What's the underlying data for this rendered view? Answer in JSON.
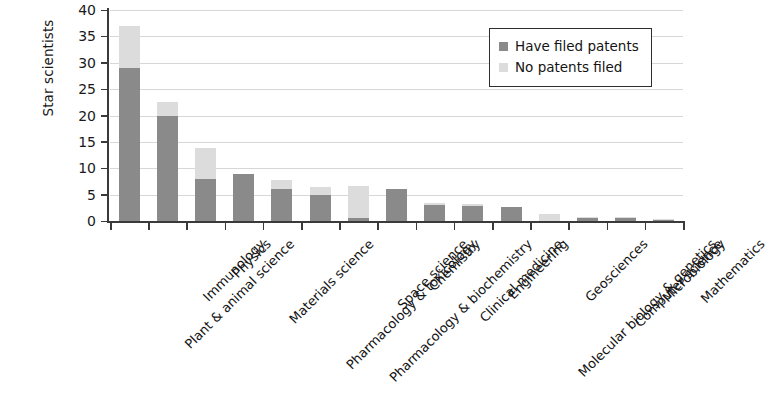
{
  "chart_data": {
    "type": "bar",
    "subtype": "stacked-vertical",
    "title": "",
    "xlabel": "",
    "ylabel": "Star scientists",
    "ylim": [
      0,
      40
    ],
    "yticks": [
      0,
      5,
      10,
      15,
      20,
      25,
      30,
      35,
      40
    ],
    "ytick_labels": [
      "0",
      "5",
      "10",
      "15",
      "20",
      "25",
      "30",
      "35",
      "40"
    ],
    "grid": "horizontal",
    "legend_position": "upper-right",
    "categories": [
      "Plant & animal science",
      "Immunology",
      "Physics",
      "Materials science",
      "Pharmacology & toxicology",
      "Pharmacology & biochemistry",
      "Space science",
      "Chemistry",
      "Clinical medicine",
      "Engineering",
      "Molecular biology & genetics",
      "Geosciences",
      "Computer science",
      "Microbiology",
      "Mathematics"
    ],
    "series": [
      {
        "name": "Have filed patents",
        "color": "#8a8a8a",
        "values": [
          29,
          20,
          8,
          9,
          6,
          5,
          0.6,
          6,
          3.1,
          2.9,
          2.7,
          0,
          0.5,
          0.5,
          0.2
        ]
      },
      {
        "name": "No patents filed",
        "color": "#dcdcdc",
        "values": [
          8,
          2.6,
          5.8,
          0,
          1.8,
          1.5,
          6.1,
          0,
          0.4,
          0.3,
          0,
          1.3,
          0.3,
          0.2,
          0.2
        ]
      }
    ],
    "totals": [
      37,
      22.6,
      13.8,
      9,
      7.8,
      6.5,
      6.7,
      6,
      3.5,
      3.2,
      2.7,
      1.3,
      0.8,
      0.7,
      0.4
    ],
    "legend_entries": [
      "Have filed patents",
      "No patents filed"
    ],
    "axis_color": "#3a3a3a",
    "gridline_color": "#d7d7d7",
    "background_color": "#ffffff"
  },
  "legend": {
    "items": [
      {
        "label": "Have filed patents",
        "color": "#8a8a8a"
      },
      {
        "label": "No patents filed",
        "color": "#dcdcdc"
      }
    ]
  }
}
